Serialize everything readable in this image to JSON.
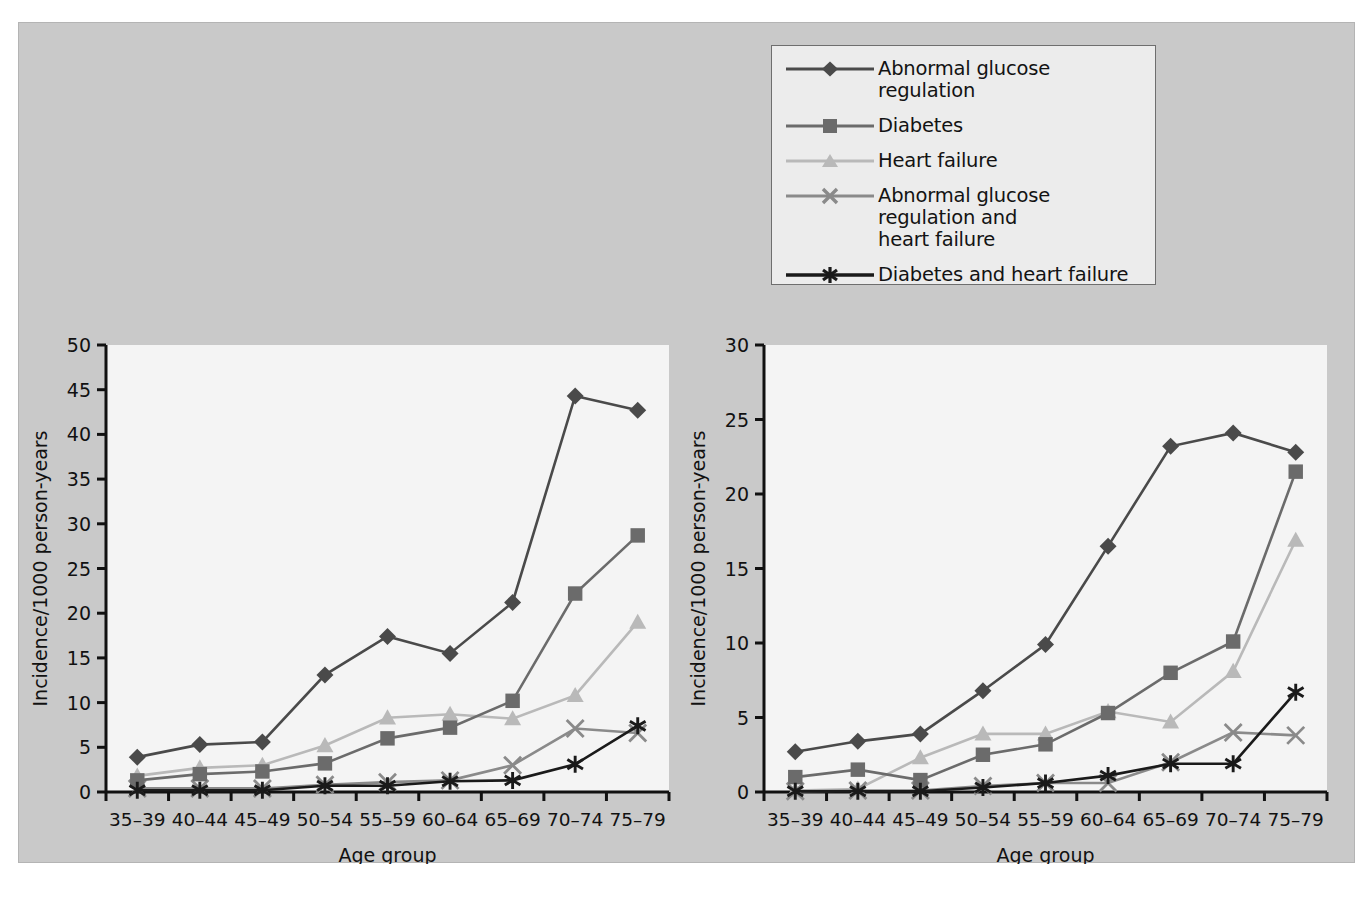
{
  "figure": {
    "background_color": "#c9c9c9",
    "plot_background_color": "#f4f4f4"
  },
  "legend": {
    "position": "top-right",
    "background_color": "#ececec",
    "border_color": "#6e6e6e",
    "items": [
      {
        "label": "Abnormal glucose regulation",
        "marker": "diamond-marker",
        "color": "#4a4a4a"
      },
      {
        "label": "Diabetes",
        "marker": "square-marker",
        "color": "#6b6b6b"
      },
      {
        "label": "Heart failure",
        "marker": "triangle-marker",
        "color": "#b9b9b9"
      },
      {
        "label": "Abnormal glucose regulation and",
        "label_line2": "heart failure",
        "marker": "cross-marker",
        "color": "#8a8a8a"
      },
      {
        "label": "Diabetes and heart failure",
        "marker": "asterisk-marker",
        "color": "#1a1a1a"
      }
    ]
  },
  "chart_data": [
    {
      "type": "line",
      "name": "left-panel",
      "title": "",
      "xlabel": "Age group",
      "ylabel": "Incidence/1000 person-years",
      "categories": [
        "35–39",
        "40–44",
        "45–49",
        "50–54",
        "55–59",
        "60–64",
        "65–69",
        "70–74",
        "75–79"
      ],
      "ylim": [
        0,
        50
      ],
      "yticks": [
        0,
        5,
        10,
        15,
        20,
        25,
        30,
        35,
        40,
        45,
        50
      ],
      "grid": false,
      "legend_position": "external-top-right",
      "series": [
        {
          "name": "Abnormal glucose regulation",
          "marker": "diamond-marker",
          "color": "#4a4a4a",
          "values": [
            3.9,
            5.3,
            5.6,
            13.1,
            17.4,
            15.5,
            21.2,
            44.3,
            42.7
          ]
        },
        {
          "name": "Diabetes",
          "marker": "square-marker",
          "color": "#6b6b6b",
          "values": [
            1.3,
            2.0,
            2.3,
            3.2,
            6.0,
            7.2,
            10.2,
            22.2,
            28.7
          ]
        },
        {
          "name": "Heart failure",
          "marker": "triangle-marker",
          "color": "#b9b9b9",
          "values": [
            1.8,
            2.7,
            3.0,
            5.2,
            8.3,
            8.7,
            8.2,
            10.8,
            19.0
          ]
        },
        {
          "name": "Abnormal glucose regulation and heart failure",
          "marker": "cross-marker",
          "color": "#8a8a8a",
          "values": [
            0.4,
            0.4,
            0.4,
            0.8,
            1.1,
            1.3,
            3.0,
            7.1,
            6.6
          ]
        },
        {
          "name": "Diabetes and heart failure",
          "marker": "asterisk-marker",
          "color": "#1a1a1a",
          "values": [
            0.2,
            0.2,
            0.2,
            0.7,
            0.7,
            1.2,
            1.3,
            3.1,
            7.4
          ]
        }
      ]
    },
    {
      "type": "line",
      "name": "right-panel",
      "title": "",
      "xlabel": "Age group",
      "ylabel": "Incidence/1000 person-years",
      "categories": [
        "35–39",
        "40–44",
        "45–49",
        "50–54",
        "55–59",
        "60–64",
        "65–69",
        "70–74",
        "75–79"
      ],
      "ylim": [
        0,
        30
      ],
      "yticks": [
        0,
        5,
        10,
        15,
        20,
        25,
        30
      ],
      "grid": false,
      "legend_position": "external-top-right",
      "series": [
        {
          "name": "Abnormal glucose regulation",
          "marker": "diamond-marker",
          "color": "#4a4a4a",
          "values": [
            2.7,
            3.4,
            3.9,
            6.8,
            9.9,
            16.5,
            23.2,
            24.1,
            22.8
          ]
        },
        {
          "name": "Diabetes",
          "marker": "square-marker",
          "color": "#6b6b6b",
          "values": [
            1.0,
            1.5,
            0.8,
            2.5,
            3.2,
            5.3,
            8.0,
            10.1,
            21.5
          ]
        },
        {
          "name": "Heart failure",
          "marker": "triangle-marker",
          "color": "#b9b9b9",
          "values": [
            0.1,
            0.2,
            2.3,
            3.9,
            3.9,
            5.4,
            4.7,
            8.1,
            16.9
          ]
        },
        {
          "name": "Abnormal glucose regulation and heart failure",
          "marker": "cross-marker",
          "color": "#8a8a8a",
          "values": [
            0.05,
            0.1,
            0.1,
            0.4,
            0.6,
            0.6,
            2.0,
            4.0,
            3.8
          ]
        },
        {
          "name": "Diabetes and heart failure",
          "marker": "asterisk-marker",
          "color": "#1a1a1a",
          "values": [
            0.05,
            0.05,
            0.05,
            0.3,
            0.6,
            1.1,
            1.9,
            1.9,
            6.7
          ]
        }
      ]
    }
  ]
}
